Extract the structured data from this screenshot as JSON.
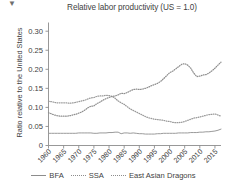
{
  "chart_data": {
    "type": "line",
    "title": "Relative labor productivity (US = 1.0)",
    "xlabel": "",
    "ylabel": "Ratio relative to the United States",
    "xlim": [
      1960,
      2017
    ],
    "ylim": [
      0,
      0.315
    ],
    "grid": false,
    "legend_position": "bottom",
    "x_tick_labels": [
      "1960",
      "1965",
      "1970",
      "1975",
      "1980",
      "1985",
      "1990",
      "1995",
      "2000",
      "2005",
      "2010",
      "2015"
    ],
    "x_ticks": [
      1960,
      1965,
      1970,
      1975,
      1980,
      1985,
      1990,
      1995,
      2000,
      2005,
      2010,
      2015
    ],
    "y_tick_labels": [
      "0",
      "0.05",
      "0.10",
      "0.15",
      "0.20",
      "0.25",
      "0.30"
    ],
    "y_ticks": [
      0,
      0.05,
      0.1,
      0.15,
      0.2,
      0.25,
      0.3
    ],
    "x": [
      1960,
      1961,
      1962,
      1963,
      1964,
      1965,
      1966,
      1967,
      1968,
      1969,
      1970,
      1971,
      1972,
      1973,
      1974,
      1975,
      1976,
      1977,
      1978,
      1979,
      1980,
      1981,
      1982,
      1983,
      1984,
      1985,
      1986,
      1987,
      1988,
      1989,
      1990,
      1991,
      1992,
      1993,
      1994,
      1995,
      1996,
      1997,
      1998,
      1999,
      2000,
      2001,
      2002,
      2003,
      2004,
      2005,
      2006,
      2007,
      2008,
      2009,
      2010,
      2011,
      2012,
      2013,
      2014,
      2015,
      2016,
      2017
    ],
    "series": [
      {
        "name": "BFA",
        "style": "solid",
        "color": "#9a9a9a",
        "values": [
          0.032,
          0.032,
          0.032,
          0.032,
          0.032,
          0.032,
          0.032,
          0.032,
          0.032,
          0.032,
          0.033,
          0.033,
          0.033,
          0.033,
          0.033,
          0.032,
          0.032,
          0.033,
          0.033,
          0.033,
          0.034,
          0.034,
          0.035,
          0.035,
          0.031,
          0.033,
          0.033,
          0.032,
          0.033,
          0.032,
          0.031,
          0.031,
          0.03,
          0.03,
          0.03,
          0.03,
          0.031,
          0.031,
          0.032,
          0.032,
          0.032,
          0.032,
          0.032,
          0.033,
          0.033,
          0.033,
          0.033,
          0.034,
          0.034,
          0.034,
          0.035,
          0.035,
          0.036,
          0.036,
          0.037,
          0.038,
          0.04,
          0.043
        ]
      },
      {
        "name": "SSA",
        "style": "dotted",
        "color": "#9a9a9a",
        "values": [
          0.116,
          0.115,
          0.113,
          0.112,
          0.112,
          0.112,
          0.112,
          0.111,
          0.112,
          0.113,
          0.115,
          0.117,
          0.119,
          0.122,
          0.125,
          0.126,
          0.129,
          0.13,
          0.13,
          0.132,
          0.131,
          0.129,
          0.124,
          0.117,
          0.112,
          0.108,
          0.102,
          0.096,
          0.092,
          0.088,
          0.084,
          0.08,
          0.076,
          0.073,
          0.071,
          0.069,
          0.068,
          0.067,
          0.066,
          0.064,
          0.063,
          0.061,
          0.06,
          0.06,
          0.061,
          0.063,
          0.066,
          0.069,
          0.072,
          0.073,
          0.075,
          0.077,
          0.079,
          0.081,
          0.082,
          0.083,
          0.08,
          0.077
        ]
      },
      {
        "name": "East Asian Dragons",
        "style": "dotted",
        "color": "#8e8e8e",
        "values": [
          0.086,
          0.083,
          0.08,
          0.078,
          0.077,
          0.077,
          0.077,
          0.078,
          0.08,
          0.082,
          0.085,
          0.088,
          0.093,
          0.099,
          0.103,
          0.104,
          0.11,
          0.114,
          0.119,
          0.123,
          0.126,
          0.129,
          0.13,
          0.133,
          0.137,
          0.136,
          0.139,
          0.143,
          0.147,
          0.148,
          0.147,
          0.148,
          0.15,
          0.153,
          0.157,
          0.16,
          0.163,
          0.168,
          0.175,
          0.183,
          0.191,
          0.195,
          0.201,
          0.207,
          0.213,
          0.215,
          0.211,
          0.203,
          0.19,
          0.181,
          0.182,
          0.185,
          0.186,
          0.19,
          0.196,
          0.203,
          0.211,
          0.219
        ]
      }
    ],
    "series_tail_east_asian": {
      "note": "continues rising to 0.30",
      "x": [
        2007,
        2008,
        2009,
        2010,
        2011,
        2012,
        2013,
        2014,
        2015,
        2016,
        2017
      ],
      "values": [
        0.203,
        0.19,
        0.181,
        0.182,
        0.185,
        0.186,
        0.19,
        0.196,
        0.203,
        0.211,
        0.219
      ]
    }
  },
  "legend": {
    "items": [
      {
        "label": "BFA",
        "style": "solid"
      },
      {
        "label": "SSA",
        "style": "dotted"
      },
      {
        "label": "East Asian Dragons",
        "style": "dotted"
      }
    ]
  },
  "colors": {
    "axis": "#8c8c8c",
    "text": "#3f3f3f",
    "background": "#ffffff"
  }
}
